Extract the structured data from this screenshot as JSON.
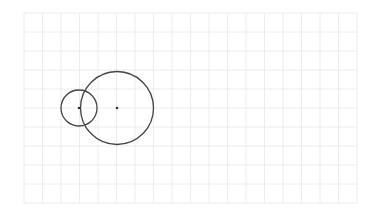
{
  "diagram": {
    "background": "#ffffff",
    "grid": {
      "x0": 24,
      "y0": 13,
      "x1": 357,
      "y1": 203,
      "cols": 18,
      "rows": 10,
      "color": "#ececec"
    },
    "circles": [
      {
        "name": "small-circle",
        "cx": 79,
        "cy": 108,
        "r": 18,
        "stroke": "#444444"
      },
      {
        "name": "large-circle",
        "cx": 117,
        "cy": 108,
        "r": 36.5,
        "stroke": "#444444"
      }
    ],
    "center_points": [
      {
        "name": "small-circle-center",
        "cx": 79,
        "cy": 108,
        "r": 1.3,
        "fill": "#333333"
      },
      {
        "name": "large-circle-center",
        "cx": 117,
        "cy": 108,
        "r": 1.3,
        "fill": "#333333"
      }
    ]
  }
}
